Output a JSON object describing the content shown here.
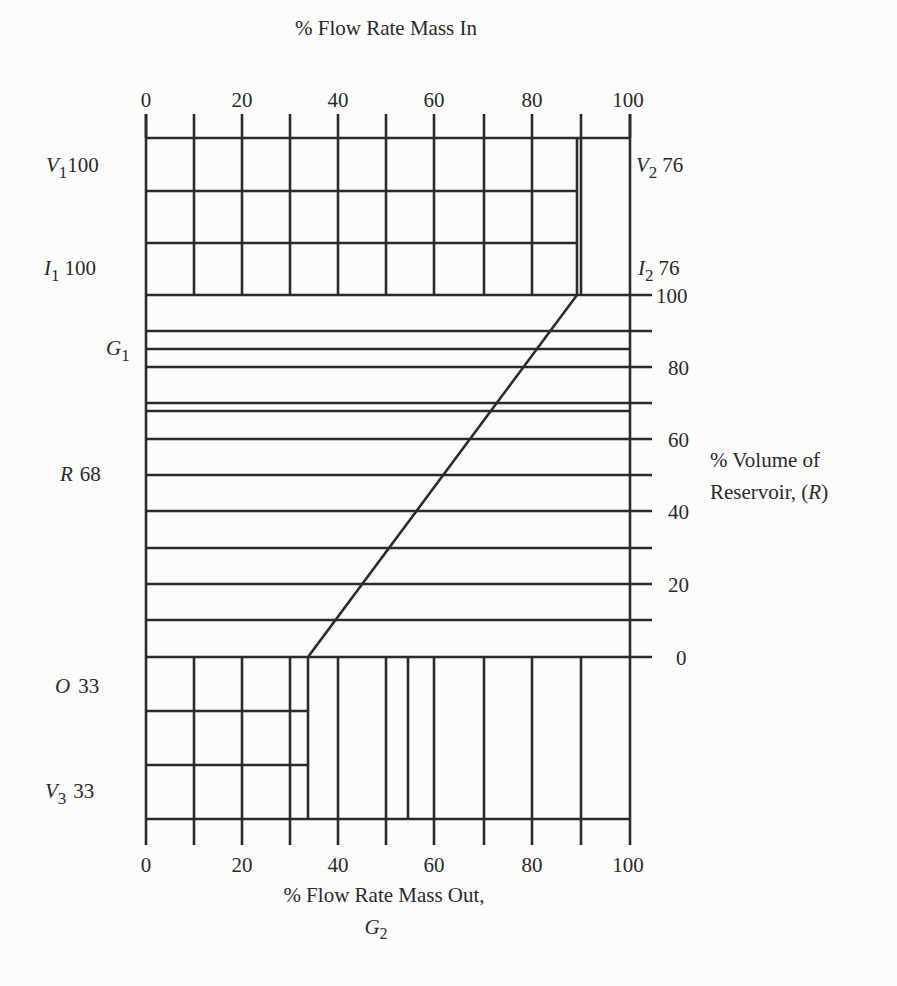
{
  "diagram": {
    "top_axis": {
      "title": "% Flow Rate Mass In",
      "ticks": [
        "0",
        "20",
        "40",
        "60",
        "80",
        "100"
      ]
    },
    "bottom_axis": {
      "title": "% Flow Rate Mass Out,",
      "subtitle": "G",
      "subtitle_sub": "2",
      "ticks": [
        "0",
        "20",
        "40",
        "60",
        "80",
        "100"
      ]
    },
    "right_axis": {
      "title_line1": "% Volume of",
      "title_line2_prefix": "Reservoir, (",
      "title_line2_var": "R",
      "title_line2_suffix": ")",
      "ticks": [
        "100",
        "80",
        "60",
        "40",
        "20",
        "0"
      ]
    },
    "left_labels": {
      "v1": {
        "var": "V",
        "sub": "1",
        "value": "100"
      },
      "i1": {
        "var": "I",
        "sub": "1",
        "value": "100"
      },
      "g1": {
        "var": "G",
        "sub": "1"
      },
      "r": {
        "var": "R",
        "value": "68"
      },
      "o": {
        "var": "O",
        "value": "33"
      },
      "v3": {
        "var": "V",
        "sub": "3",
        "value": "33"
      }
    },
    "right_labels": {
      "v2": {
        "var": "V",
        "sub": "2",
        "value": "76"
      },
      "i2": {
        "var": "I",
        "sub": "2",
        "value": "76"
      }
    },
    "values": {
      "V1": 100,
      "I1": 100,
      "V2": 76,
      "I2": 76,
      "R": 68,
      "O": 33,
      "V3": 33,
      "G1_percent_in": 90,
      "G2_percent_out": 33,
      "extra_reservoir_lines": [
        85,
        68
      ],
      "extra_out_line": 55
    }
  }
}
